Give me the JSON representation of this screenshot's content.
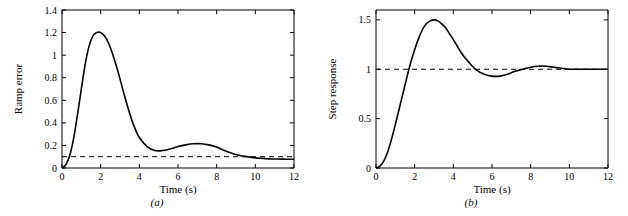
{
  "figure": {
    "width": 628,
    "height": 216,
    "background": "#ffffff",
    "line_color": "#000000",
    "dashed_color": "#000000"
  },
  "chart_data": [
    {
      "type": "line",
      "panel_label": "(a)",
      "title": "",
      "xlabel": "Time (s)",
      "ylabel": "Ramp error",
      "xlim": [
        0,
        12
      ],
      "ylim": [
        0,
        1.4
      ],
      "xticks": [
        0,
        2,
        4,
        6,
        8,
        10,
        12
      ],
      "xticklabels": [
        "0",
        "2",
        "4",
        "6",
        "8",
        "10",
        "12"
      ],
      "yticks": [
        0,
        0.2,
        0.4,
        0.6,
        0.8,
        1.0,
        1.2,
        1.4
      ],
      "yticklabels": [
        "0",
        "0.2",
        "0.4",
        "0.6",
        "0.8",
        "1",
        "1.2",
        "1.4"
      ],
      "grid": false,
      "legend": "none",
      "annotations": [
        {
          "type": "hline",
          "y": 0.1,
          "style": "dashed",
          "label": "steady-state ramp error"
        }
      ],
      "series": [
        {
          "name": "Ramp error",
          "x": [
            0,
            0.2,
            0.4,
            0.6,
            0.8,
            1.0,
            1.2,
            1.4,
            1.6,
            1.8,
            2.0,
            2.2,
            2.4,
            2.6,
            2.8,
            3.0,
            3.2,
            3.4,
            3.6,
            3.8,
            4.0,
            4.4,
            4.8,
            5.2,
            5.6,
            6.0,
            6.4,
            6.8,
            7.2,
            7.6,
            8.0,
            8.4,
            8.8,
            9.2,
            9.6,
            10.0,
            10.4,
            10.8,
            11.2,
            11.6,
            12.0
          ],
          "y": [
            0,
            0.03,
            0.11,
            0.26,
            0.47,
            0.7,
            0.92,
            1.08,
            1.17,
            1.2,
            1.2,
            1.17,
            1.11,
            1.02,
            0.91,
            0.79,
            0.66,
            0.54,
            0.43,
            0.34,
            0.27,
            0.19,
            0.155,
            0.155,
            0.17,
            0.19,
            0.205,
            0.215,
            0.215,
            0.205,
            0.185,
            0.155,
            0.13,
            0.11,
            0.1,
            0.09,
            0.085,
            0.08,
            0.08,
            0.078,
            0.078
          ]
        }
      ]
    },
    {
      "type": "line",
      "panel_label": "(b)",
      "title": "",
      "xlabel": "Time (s)",
      "ylabel": "Step response",
      "xlim": [
        0,
        12
      ],
      "ylim": [
        0,
        1.6
      ],
      "xticks": [
        0,
        2,
        4,
        6,
        8,
        10,
        12
      ],
      "xticklabels": [
        "0",
        "2",
        "4",
        "6",
        "8",
        "10",
        "12"
      ],
      "yticks": [
        0,
        0.5,
        1.0,
        1.5
      ],
      "yticklabels": [
        "0",
        "0.5",
        "1",
        "1.5"
      ],
      "grid": false,
      "legend": "none",
      "annotations": [
        {
          "type": "hline",
          "y": 1.0,
          "style": "dashed",
          "label": "final value"
        }
      ],
      "series": [
        {
          "name": "Step response",
          "x": [
            0,
            0.2,
            0.4,
            0.6,
            0.8,
            1.0,
            1.2,
            1.4,
            1.6,
            1.8,
            2.0,
            2.2,
            2.4,
            2.6,
            2.8,
            3.0,
            3.2,
            3.4,
            3.6,
            3.8,
            4.0,
            4.4,
            4.8,
            5.2,
            5.6,
            6.0,
            6.4,
            6.8,
            7.2,
            7.6,
            8.0,
            8.4,
            8.8,
            9.2,
            9.6,
            10.0,
            10.4,
            10.8,
            11.2,
            11.6,
            12.0
          ],
          "y": [
            0,
            0.02,
            0.07,
            0.16,
            0.29,
            0.44,
            0.6,
            0.76,
            0.92,
            1.07,
            1.2,
            1.31,
            1.4,
            1.46,
            1.49,
            1.5,
            1.49,
            1.46,
            1.42,
            1.36,
            1.3,
            1.17,
            1.07,
            0.99,
            0.95,
            0.93,
            0.93,
            0.95,
            0.98,
            1.0,
            1.02,
            1.03,
            1.03,
            1.02,
            1.01,
            1.0,
            1.0,
            1.0,
            1.0,
            1.0,
            1.0
          ]
        }
      ]
    }
  ]
}
